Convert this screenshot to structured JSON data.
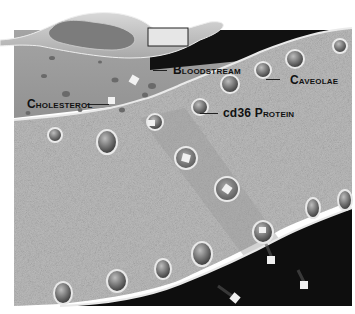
{
  "diagram": {
    "type": "illustration",
    "labels": {
      "bloodstream": "Bloodstream",
      "caveolae": "Caveolae",
      "cholesterol": "Cholesterol",
      "cd36": "cd36 Protein"
    },
    "colors": {
      "background": "#ffffff",
      "plasma": "#9a9a9a",
      "cytoplasm": "#b8b8b8",
      "dark_region": "#0e0e0e",
      "membrane": "#e8e8e8",
      "vessel": "#c9c9c9",
      "label_text": "#111111"
    }
  }
}
